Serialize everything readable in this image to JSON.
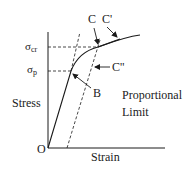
{
  "diagram": {
    "type": "stress-strain curve",
    "axes": {
      "x_label": "Strain",
      "y_label": "Stress",
      "origin_label": "O"
    },
    "y_levels": {
      "sigma_cr": {
        "symbol": "σ",
        "subscript": "cr"
      },
      "sigma_p": {
        "symbol": "σ",
        "subscript": "p"
      }
    },
    "points": {
      "B": "B",
      "C": "C",
      "C_prime": "C'",
      "C_double_prime": "C''"
    },
    "annotation": {
      "line1": "Proportional",
      "line2": "Limit"
    },
    "colors": {
      "line": "#1a1a1a",
      "background": "#ffffff"
    }
  }
}
